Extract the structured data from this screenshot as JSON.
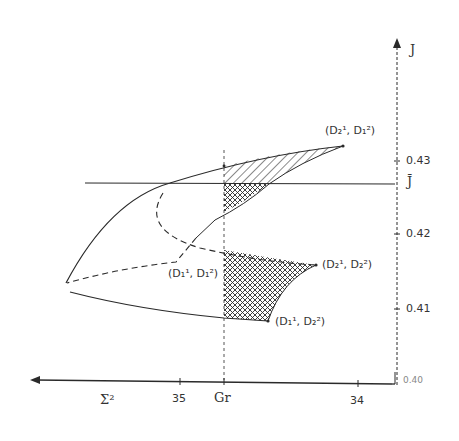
{
  "diagram": {
    "type": "hand-drawn parameter-space diagram",
    "colors": {
      "ink": "#2a2a2a",
      "background": "#ffffff"
    },
    "axes": {
      "vertical": {
        "name": "J",
        "ticks": [
          "0.43",
          "0.42",
          "0.41"
        ],
        "bottom_label": "0.40"
      },
      "horizontal": {
        "ticks": [
          "34",
          "35"
        ],
        "labels": {
          "sigma2": "Σ²",
          "sigma_r": "Gr"
        }
      },
      "threshold_label": "J̄"
    },
    "points": {
      "top_right": "(D₂¹, D₁²)",
      "middle_right": "(D₂¹, D₂²)",
      "middle_left": "(D₁¹, D₁²)",
      "bottom_right": "(D₁¹, D₂²)"
    },
    "regions": {
      "hatched": "single-hatched region above J̄",
      "crosshatched": "cross-hatched regions right of Gr"
    }
  }
}
